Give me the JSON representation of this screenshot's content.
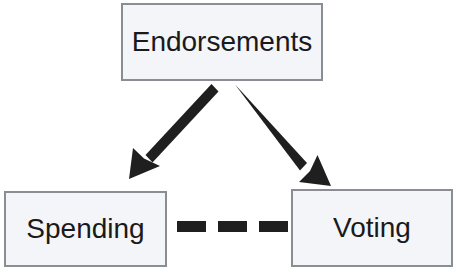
{
  "diagram": {
    "background_color": "#ffffff",
    "node_fill_color": "#f4f5f8",
    "node_border_color": "#8a8d93",
    "connector_color": "#1f1f1f",
    "nodes": [
      {
        "id": "endorsements",
        "label": "Endorsements"
      },
      {
        "id": "spending",
        "label": "Spending"
      },
      {
        "id": "voting",
        "label": "Voting"
      }
    ],
    "connectors": [
      {
        "id": "endorsements-to-spending",
        "type": "solid-arrow",
        "from": "endorsements",
        "to": "spending",
        "direction": "down-left"
      },
      {
        "id": "endorsements-to-voting",
        "type": "solid-arrow",
        "from": "endorsements",
        "to": "voting",
        "direction": "down-right"
      },
      {
        "id": "spending-voting-dashed",
        "type": "dashed-line",
        "from": "spending",
        "to": "voting",
        "dash_count": 3
      }
    ]
  }
}
